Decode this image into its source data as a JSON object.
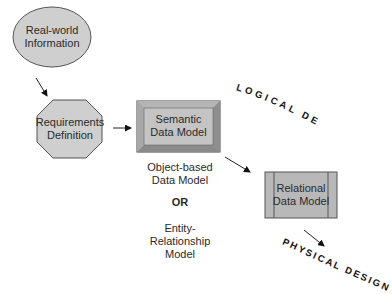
{
  "nodes": {
    "real_world": {
      "line1": "Real-world",
      "line2": "Information",
      "shape": "ellipse"
    },
    "requirements": {
      "line1": "Requirements",
      "line2": "Definition",
      "shape": "octagon"
    },
    "semantic": {
      "line1": "Semantic",
      "line2": "Data Model",
      "shape": "beveled-rectangle"
    },
    "relational": {
      "line1": "Relational",
      "line2": "Data Model",
      "shape": "process-rectangle"
    }
  },
  "semantic_options": {
    "option1_line1": "Object-based",
    "option1_line2": "Data Model",
    "or": "OR",
    "option2_line1": "Entity-",
    "option2_line2": "Relationship",
    "option2_line3": "Model"
  },
  "phases": {
    "logical": "LOGICAL DESIGN",
    "physical": "PHYSICAL DESIGN"
  },
  "colors": {
    "fill": "#c8c8c8",
    "stroke": "#555555",
    "text": "#222222"
  }
}
